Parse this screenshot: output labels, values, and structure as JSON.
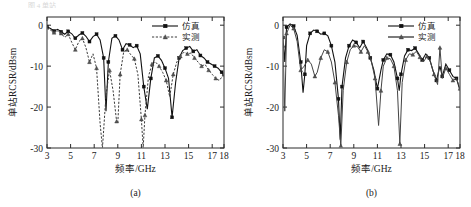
{
  "figure": {
    "top_fragment": "图 4 单站",
    "panels": [
      {
        "caption": "(a)",
        "legend": [
          {
            "label": "仿真",
            "style": "solid-square"
          },
          {
            "label": "实测",
            "style": "dashed-triangle"
          }
        ]
      },
      {
        "caption": "(b)",
        "legend": [
          {
            "label": "仿真",
            "style": "solid-square"
          },
          {
            "label": "实测",
            "style": "solid-triangle"
          }
        ]
      }
    ]
  },
  "chart_data": [
    {
      "type": "line",
      "title": "(a)",
      "xlabel": "频率/GHz",
      "ylabel": "单站RCSR/dBsm",
      "xlim": [
        3,
        18
      ],
      "ylim": [
        -30,
        2
      ],
      "xticks": [
        3,
        5,
        7,
        9,
        11,
        13,
        15,
        17,
        18
      ],
      "xticklabels": [
        "3",
        "5",
        "7",
        "9",
        "11",
        "13",
        "15",
        "17",
        "18"
      ],
      "yticks": [
        0,
        -10,
        -20,
        -30
      ],
      "yticklabels": [
        "0",
        "-10",
        "-20",
        "-30"
      ],
      "grid": false,
      "legend_position": "top-right",
      "series": [
        {
          "name": "仿真",
          "style": "solid-square",
          "x": [
            3.0,
            3.3,
            3.6,
            3.9,
            4.2,
            4.5,
            4.8,
            5.1,
            5.4,
            5.7,
            6.0,
            6.3,
            6.6,
            6.9,
            7.2,
            7.5,
            7.8,
            8.0,
            8.2,
            8.5,
            8.8,
            9.1,
            9.4,
            9.7,
            10.0,
            10.3,
            10.6,
            10.9,
            11.2,
            11.5,
            11.8,
            12.1,
            12.4,
            12.7,
            13.0,
            13.3,
            13.6,
            13.9,
            14.2,
            14.5,
            14.8,
            15.1,
            15.4,
            15.7,
            16.0,
            16.3,
            16.6,
            16.9,
            17.2,
            17.5,
            17.8,
            18.0
          ],
          "y": [
            -0.4,
            -0.8,
            -1.4,
            -1.0,
            -1.6,
            -2.2,
            -1.5,
            -2.1,
            -3.2,
            -2.4,
            -1.9,
            -2.7,
            -4.0,
            -2.8,
            -2.2,
            -3.6,
            -8.0,
            -21.0,
            -9.0,
            -3.2,
            -2.6,
            -3.6,
            -6.0,
            -4.5,
            -4.8,
            -5.5,
            -5.0,
            -7.0,
            -15.0,
            -20.5,
            -13.0,
            -8.0,
            -7.5,
            -8.6,
            -10.5,
            -13.0,
            -22.5,
            -14.0,
            -8.0,
            -6.2,
            -5.6,
            -5.2,
            -6.4,
            -6.0,
            -7.4,
            -8.0,
            -9.0,
            -9.5,
            -10.0,
            -10.5,
            -11.5,
            -12.5
          ]
        },
        {
          "name": "实测",
          "style": "dashed-triangle",
          "x": [
            3.0,
            3.3,
            3.6,
            3.9,
            4.2,
            4.5,
            4.8,
            5.1,
            5.4,
            5.7,
            6.0,
            6.3,
            6.6,
            6.9,
            7.2,
            7.5,
            7.7,
            8.0,
            8.3,
            8.6,
            8.9,
            9.0,
            9.2,
            9.5,
            9.8,
            10.1,
            10.4,
            10.7,
            11.0,
            11.15,
            11.3,
            11.6,
            11.9,
            12.2,
            12.5,
            12.8,
            13.1,
            13.4,
            13.7,
            14.0,
            14.3,
            14.6,
            14.9,
            15.2,
            15.5,
            15.8,
            16.1,
            16.4,
            16.7,
            17.0,
            17.3,
            17.6,
            18.0
          ],
          "y": [
            -0.6,
            -1.2,
            -1.8,
            -1.4,
            -2.0,
            -3.0,
            -2.2,
            -4.2,
            -6.0,
            -4.0,
            -3.2,
            -5.5,
            -9.0,
            -7.0,
            -10.5,
            -24.0,
            -30.0,
            -17.0,
            -11.0,
            -16.0,
            -23.5,
            -24.0,
            -12.0,
            -6.5,
            -6.0,
            -7.2,
            -8.2,
            -12.0,
            -23.0,
            -30.0,
            -22.0,
            -12.5,
            -9.5,
            -9.0,
            -10.0,
            -11.5,
            -13.5,
            -17.5,
            -12.0,
            -9.0,
            -7.6,
            -6.6,
            -7.0,
            -6.8,
            -8.0,
            -9.0,
            -10.0,
            -9.6,
            -11.0,
            -12.0,
            -13.0,
            -13.5,
            -12.0
          ]
        }
      ]
    },
    {
      "type": "line",
      "title": "(b)",
      "xlabel": "频率/GHz",
      "ylabel": "单站RCSR/dBsm",
      "xlim": [
        3,
        18
      ],
      "ylim": [
        -30,
        2
      ],
      "xticks": [
        3,
        5,
        7,
        9,
        11,
        13,
        15,
        17,
        18
      ],
      "xticklabels": [
        "3",
        "5",
        "7",
        "9",
        "11",
        "13",
        "15",
        "17",
        "18"
      ],
      "yticks": [
        0,
        -10,
        -20,
        -30
      ],
      "yticklabels": [
        "0",
        "-10",
        "-20",
        "-30"
      ],
      "grid": false,
      "legend_position": "top-right",
      "series": [
        {
          "name": "仿真",
          "style": "solid-square",
          "x": [
            3.0,
            3.15,
            3.3,
            3.6,
            3.9,
            4.2,
            4.5,
            4.7,
            4.85,
            5.0,
            5.3,
            5.6,
            5.9,
            6.2,
            6.5,
            6.8,
            7.1,
            7.4,
            7.7,
            7.85,
            8.0,
            8.3,
            8.6,
            8.9,
            9.2,
            9.5,
            9.8,
            10.1,
            10.4,
            10.7,
            11.0,
            11.3,
            11.5,
            11.8,
            12.1,
            12.4,
            12.7,
            12.85,
            13.0,
            13.3,
            13.6,
            13.9,
            14.2,
            14.5,
            14.8,
            15.1,
            15.4,
            15.7,
            16.0,
            16.3,
            16.5,
            16.8,
            17.1,
            17.4,
            17.7,
            18.0
          ],
          "y": [
            -3.0,
            -9.0,
            -0.5,
            0.3,
            -0.2,
            -2.5,
            -9.0,
            -16.5,
            -12.0,
            -5.0,
            -2.0,
            -1.2,
            -1.5,
            -2.2,
            -2.0,
            -2.6,
            -5.0,
            -9.0,
            -18.0,
            -28.0,
            -15.0,
            -8.0,
            -5.0,
            -3.6,
            -4.2,
            -5.5,
            -4.0,
            -5.6,
            -8.0,
            -11.0,
            -15.5,
            -11.0,
            -8.5,
            -7.0,
            -7.2,
            -9.0,
            -13.0,
            -16.0,
            -12.0,
            -7.5,
            -6.0,
            -6.2,
            -5.6,
            -7.0,
            -8.5,
            -7.0,
            -8.0,
            -11.0,
            -13.5,
            -10.0,
            -12.5,
            -9.5,
            -11.0,
            -12.5,
            -13.0,
            -16.0
          ]
        },
        {
          "name": "实测",
          "style": "solid-triangle",
          "x": [
            3.0,
            3.15,
            3.3,
            3.6,
            3.9,
            4.2,
            4.5,
            4.8,
            5.1,
            5.4,
            5.7,
            5.9,
            6.2,
            6.5,
            6.8,
            7.1,
            7.4,
            7.7,
            7.9,
            8.1,
            8.4,
            8.7,
            9.0,
            9.3,
            9.6,
            9.9,
            10.2,
            10.5,
            10.8,
            11.1,
            11.3,
            11.5,
            11.8,
            12.1,
            12.4,
            12.7,
            12.9,
            13.1,
            13.4,
            13.7,
            14.0,
            14.3,
            14.6,
            14.9,
            15.2,
            15.5,
            15.8,
            16.1,
            16.3,
            16.5,
            16.8,
            17.1,
            17.4,
            17.7,
            18.0
          ],
          "y": [
            -5.0,
            -21.0,
            -2.0,
            0.0,
            -0.8,
            -4.0,
            -11.0,
            -10.0,
            -8.5,
            -9.5,
            -12.5,
            -11.5,
            -8.0,
            -6.0,
            -6.5,
            -9.0,
            -14.0,
            -22.0,
            -29.5,
            -16.0,
            -9.0,
            -6.0,
            -5.0,
            -5.2,
            -6.5,
            -5.0,
            -6.5,
            -9.0,
            -13.0,
            -24.5,
            -16.0,
            -10.0,
            -8.0,
            -8.2,
            -10.0,
            -16.0,
            -29.0,
            -14.0,
            -8.5,
            -7.0,
            -7.2,
            -6.4,
            -7.8,
            -9.0,
            -7.6,
            -9.0,
            -12.0,
            -14.5,
            -5.5,
            -13.0,
            -10.5,
            -12.0,
            -13.5,
            -13.0,
            -15.5
          ]
        }
      ]
    }
  ]
}
